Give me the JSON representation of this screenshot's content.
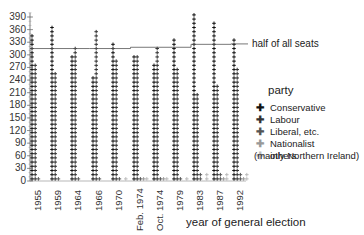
{
  "chart_data": {
    "type": "bar",
    "title": "",
    "xlabel": "year of general election",
    "ylabel": "",
    "ylim": [
      0,
      390
    ],
    "yticks": [
      0,
      30,
      60,
      90,
      120,
      150,
      180,
      210,
      240,
      270,
      300,
      330,
      360,
      390
    ],
    "categories": [
      "1955",
      "1959",
      "1964",
      "1966",
      "1970",
      "Feb. 1974",
      "Oct. 1974",
      "1979",
      "1983",
      "1987",
      "1992"
    ],
    "series": [
      {
        "name": "Conservative",
        "values": [
          345,
          365,
          304,
          253,
          330,
          297,
          277,
          339,
          397,
          376,
          336
        ],
        "color": "#111111"
      },
      {
        "name": "Labour",
        "values": [
          277,
          258,
          317,
          364,
          288,
          301,
          319,
          269,
          209,
          229,
          271
        ],
        "color": "#333333"
      },
      {
        "name": "Liberal, etc.",
        "values": [
          6,
          6,
          9,
          12,
          6,
          14,
          13,
          11,
          23,
          22,
          20
        ],
        "color": "#555555"
      },
      {
        "name": "Nationalist",
        "values": [
          0,
          0,
          0,
          0,
          1,
          9,
          14,
          4,
          4,
          6,
          7
        ],
        "color": "#999999"
      },
      {
        "name": "others (mainly Northern Ireland)",
        "values": [
          2,
          1,
          0,
          1,
          5,
          14,
          12,
          12,
          17,
          17,
          17
        ],
        "color": "#bbbbbb"
      }
    ],
    "reference_line": {
      "label": "half of all seats",
      "values": [
        315,
        315,
        315,
        315,
        315,
        318,
        318,
        318,
        325,
        325,
        326
      ]
    },
    "legend": {
      "title": "party",
      "position": "right"
    },
    "grid": false
  },
  "labels": {
    "half": "half of all seats",
    "legend_title": "party",
    "legend_note": "(mainly Northern Ireland)",
    "xlabel": "year of general election"
  }
}
